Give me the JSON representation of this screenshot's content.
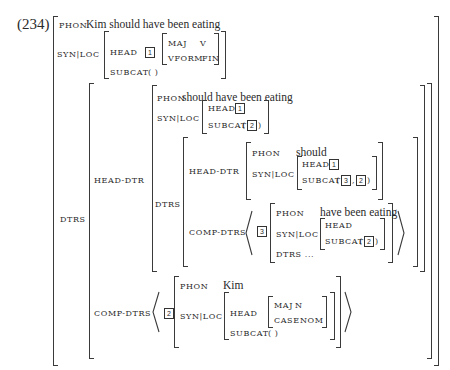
{
  "example_number": "(234)",
  "root": {
    "phon_label": "PHON",
    "phon_value": "Kim should have been eating",
    "synloc_label": "SYN|LOC",
    "head_label": "HEAD",
    "head_tag": "1",
    "maj_label": "MAJ",
    "maj_value": "V",
    "vform_label": "VFORM",
    "vform_value": "FIN",
    "subcat_label": "SUBCAT",
    "subcat_value": "( )",
    "dtrs_label": "DTRS"
  },
  "head_dtr": {
    "label": "HEAD-DTR",
    "phon_label": "PHON",
    "phon_value": "should have been eating",
    "synloc_label": "SYN|LOC",
    "head_label": "HEAD",
    "head_tag": "1",
    "subcat_label": "SUBCAT",
    "subcat_open": "(",
    "subcat_tag": "2",
    "subcat_close": ")",
    "dtrs_label": "DTRS",
    "inner_head_dtr": {
      "label": "HEAD-DTR",
      "phon_label": "PHON",
      "phon_value": "should",
      "synloc_label": "SYN|LOC",
      "head_label": "HEAD",
      "head_tag": "1",
      "subcat_label": "SUBCAT",
      "subcat_open": "(",
      "subcat_tag_a": "3",
      "subcat_sep": ",",
      "subcat_tag_b": "2",
      "subcat_close": ")"
    },
    "inner_comp_dtrs": {
      "label": "COMP-DTRS",
      "tag": "3",
      "phon_label": "PHON",
      "phon_value": "have been eating",
      "synloc_label": "SYN|LOC",
      "head_label": "HEAD",
      "subcat_label": "SUBCAT",
      "subcat_open": "(",
      "subcat_tag": "2",
      "subcat_close": ")",
      "dtrs_label": "DTRS ..."
    }
  },
  "comp_dtrs": {
    "label": "COMP-DTRS",
    "tag": "2",
    "phon_label": "PHON",
    "phon_value": "Kim",
    "synloc_label": "SYN|LOC",
    "head_label": "HEAD",
    "maj_label": "MAJ",
    "maj_value": "N",
    "case_label": "CASE",
    "case_value": "NOM",
    "subcat_label": "SUBCAT",
    "subcat_value": "( )"
  }
}
